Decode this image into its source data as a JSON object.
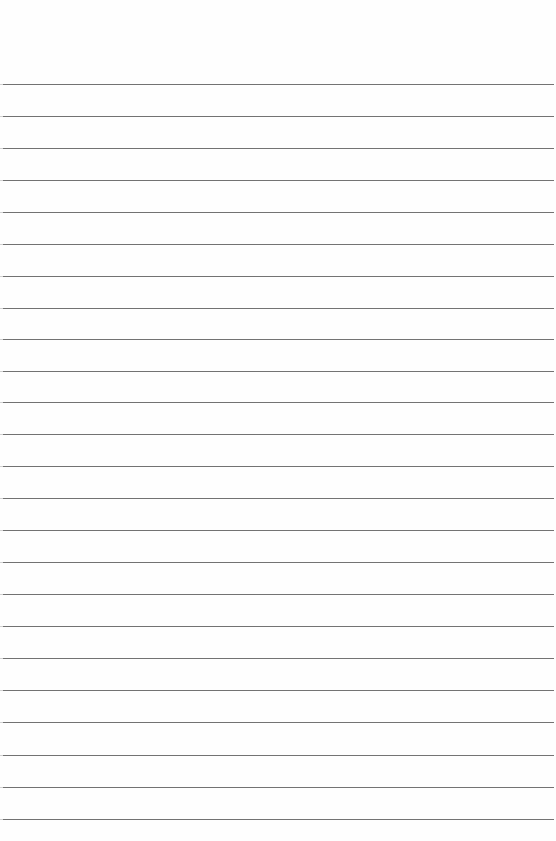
{
  "page": {
    "type": "lined-paper",
    "background": "#fefefe",
    "line_color": "#5a5a5a",
    "line_count": 24,
    "first_line_y": 84,
    "line_spacing": 32,
    "lines": [
      84,
      116,
      148,
      180,
      212,
      244,
      276,
      308,
      339,
      371,
      402,
      434,
      466,
      498,
      530,
      562,
      594,
      626,
      658,
      690,
      722,
      755,
      787,
      819
    ]
  }
}
